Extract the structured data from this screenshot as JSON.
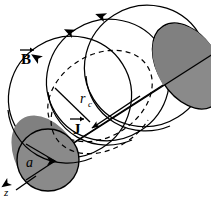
{
  "figure": {
    "name": "magnetic-field-of-current-carrying-cylinder",
    "background_color": "#ffffff",
    "stroke_color": "#000000",
    "cylinder_fill": "#808080",
    "cylinder_cap_fill": "#8a8a8a"
  },
  "labels": {
    "b_field": {
      "text": "B",
      "vector": true,
      "meaning": "magnetic-field-vector",
      "x": 22,
      "y": 62
    },
    "current_density": {
      "text": "J",
      "vector": true,
      "meaning": "current-density-vector",
      "x": 72,
      "y": 132
    },
    "amperian_radius": {
      "text": "r",
      "subscript": "c",
      "meaning": "amperian-loop-radius",
      "x": 82,
      "y": 103
    },
    "cylinder_radius": {
      "text": "a",
      "meaning": "cylinder-radius",
      "x": 28,
      "y": 170
    },
    "z_axis": {
      "text": "z",
      "meaning": "z-axis-label",
      "x": 6,
      "y": 193
    }
  },
  "geometry": {
    "cylinder": {
      "axis_angle_deg": -32,
      "left_cap_center": [
        48,
        160
      ],
      "left_cap_radius": 31,
      "right_cap_center": [
        192,
        68
      ],
      "right_cap_radius": 48
    },
    "field_circles": [
      {
        "cx": 70,
        "cy": 97,
        "r": 62,
        "name": "b-field-circle-left"
      },
      {
        "cx": 104,
        "cy": 78,
        "r": 62,
        "name": "b-field-circle-mid"
      },
      {
        "cx": 140,
        "cy": 72,
        "r": 62,
        "name": "b-field-circle-right"
      }
    ],
    "amperian_loop": {
      "cx": 98,
      "cy": 95,
      "rx": 55,
      "ry": 42,
      "dashed": true,
      "name": "amperian-loop"
    },
    "arrowheads": [
      {
        "x": 40,
        "y": 70,
        "dir_deg": 215,
        "name": "b-arrowhead-left"
      },
      {
        "x": 76,
        "y": 36,
        "dir_deg": 205,
        "name": "b-arrowhead-mid"
      },
      {
        "x": 108,
        "y": 20,
        "dir_deg": 200,
        "name": "b-arrowhead-right"
      }
    ]
  }
}
